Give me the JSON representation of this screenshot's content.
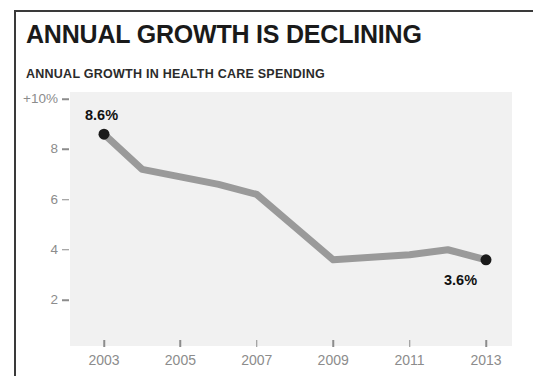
{
  "figure": {
    "title": "ANNUAL GROWTH IS DECLINING",
    "subtitle": "ANNUAL GROWTH IN HEALTH CARE SPENDING"
  },
  "colors": {
    "title": "#1a1a1a",
    "subtitle": "#2b2b2b",
    "line": "#9a9a9a",
    "marker": "#1a1a1a",
    "plot_background": "#f1f1f1",
    "tick": "#8c8c8c",
    "frame": "#3a3a3a"
  },
  "chart_data": {
    "type": "line",
    "title": "ANNUAL GROWTH IS DECLINING",
    "subtitle": "ANNUAL GROWTH IN HEALTH CARE SPENDING",
    "xlabel": "",
    "ylabel": "",
    "xlim": [
      2002.4,
      2013.6
    ],
    "ylim": [
      1.0,
      10.0
    ],
    "grid": false,
    "legend": null,
    "ytick_labels": [
      "+10%",
      "8",
      "6",
      "4",
      "2"
    ],
    "ytick_values": [
      10,
      8,
      6,
      4,
      2
    ],
    "xtick_labels": [
      "2003",
      "2005",
      "2007",
      "2009",
      "2011",
      "2013"
    ],
    "xtick_values": [
      2003,
      2005,
      2007,
      2009,
      2011,
      2013
    ],
    "x": [
      2003,
      2004,
      2005,
      2006,
      2007,
      2008,
      2009,
      2010,
      2011,
      2012,
      2013
    ],
    "values": [
      8.6,
      7.2,
      6.9,
      6.6,
      6.2,
      4.9,
      3.6,
      3.7,
      3.8,
      4.0,
      3.6
    ],
    "annotations": [
      {
        "name": "start-value",
        "text": "8.6%",
        "x": 2003,
        "y": 8.6
      },
      {
        "name": "end-value",
        "text": "3.6%",
        "x": 2013,
        "y": 3.6
      }
    ],
    "markers": [
      {
        "x": 2003,
        "y": 8.6
      },
      {
        "x": 2013,
        "y": 3.6
      }
    ]
  }
}
